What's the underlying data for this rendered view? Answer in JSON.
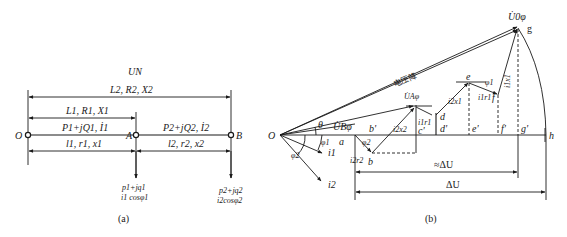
{
  "figure_a": {
    "caption": "(a)",
    "top_label": "UN",
    "span_OB_label": "L2, R2, X2",
    "span_OA_label": "L1, R1, X1",
    "segment_OA_load": "P1+jQ1, İ1",
    "segment_AB_load": "P2+jQ2, İ2",
    "segment_OA_params": "l1, r1, x1",
    "segment_AB_params": "l2, r2, x2",
    "nodes": [
      "O",
      "A",
      "B"
    ],
    "load_A": {
      "line1": "p1+jq1",
      "line2": "i1 cosφ1"
    },
    "load_B": {
      "line1": "p2+jq2",
      "line2": "i2cosφ2"
    }
  },
  "figure_b": {
    "caption": "(b)",
    "labels": {
      "U0phi": "U̇0φ",
      "g": "g",
      "voltage_drop": "电压降",
      "UAphi": "U̇Aφ",
      "UBphi": "U̇Bφ",
      "theta": "θ",
      "phi1": "φ1",
      "phi2": "φ2",
      "O": "O",
      "a": "a",
      "b": "b",
      "b_prime": "b'",
      "c_prime": "c'",
      "d": "d",
      "d_prime": "d'",
      "e": "e",
      "e_prime": "e'",
      "f": "f",
      "f_prime": "f'",
      "g_prime": "g'",
      "h": "h",
      "i1": "i1",
      "i2": "i2",
      "i2r2": "i2r2",
      "i2x2": "i2x2",
      "i1r1_small": "i1r1",
      "i2x1": "i2x1",
      "i1r1": "i1r1",
      "i1x1": "i1x1",
      "approx_dU": "≈ΔU",
      "dU": "ΔU"
    }
  }
}
